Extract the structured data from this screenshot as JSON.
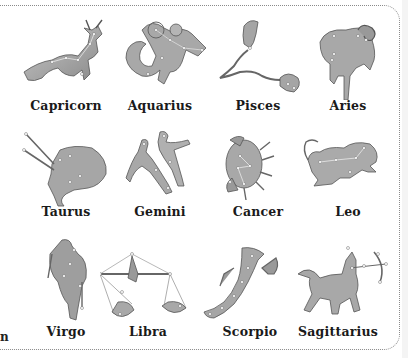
{
  "page": {
    "background": "#ffffff",
    "border_style": "dotted rounded frame",
    "figure_fill": "#a9a9a9",
    "star_color": "#ffffff",
    "cut_off_text": "n"
  },
  "constellations": [
    {
      "name": "Capricorn",
      "row": 1,
      "col": 1,
      "figure": "sea-goat"
    },
    {
      "name": "Aquarius",
      "row": 1,
      "col": 2,
      "figure": "water-bearer"
    },
    {
      "name": "Pisces",
      "row": 1,
      "col": 3,
      "figure": "two-fish"
    },
    {
      "name": "Aries",
      "row": 1,
      "col": 4,
      "figure": "ram"
    },
    {
      "name": "Taurus",
      "row": 2,
      "col": 1,
      "figure": "bull"
    },
    {
      "name": "Gemini",
      "row": 2,
      "col": 2,
      "figure": "twins"
    },
    {
      "name": "Cancer",
      "row": 2,
      "col": 3,
      "figure": "crab"
    },
    {
      "name": "Leo",
      "row": 2,
      "col": 4,
      "figure": "lion"
    },
    {
      "name": "Virgo",
      "row": 3,
      "col": 1,
      "figure": "maiden"
    },
    {
      "name": "Libra",
      "row": 3,
      "col": 2,
      "figure": "scales"
    },
    {
      "name": "Scorpio",
      "row": 3,
      "col": 3,
      "figure": "scorpion"
    },
    {
      "name": "Sagittarius",
      "row": 3,
      "col": 4,
      "figure": "archer-centaur"
    }
  ]
}
